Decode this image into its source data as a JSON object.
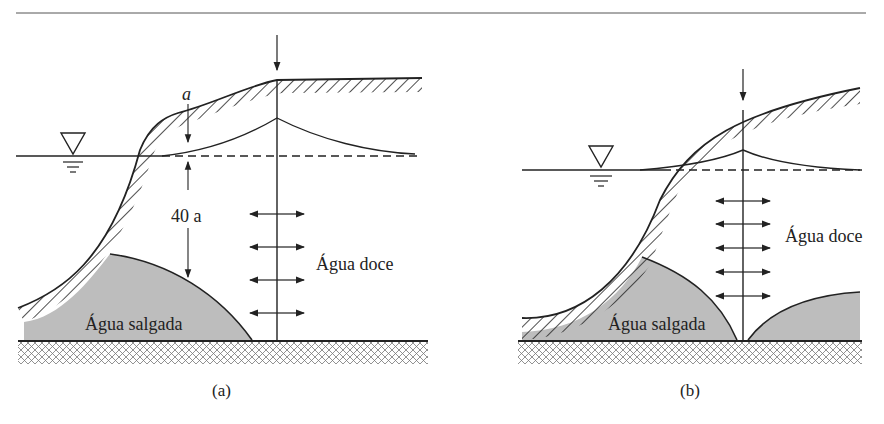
{
  "figure": {
    "panels": [
      {
        "id": "a",
        "caption": "(a)",
        "fresh_label": "Água doce",
        "salt_label": "Água salgada",
        "thickness_label_top": "a",
        "thickness_label_depth": "40 a",
        "pumping_arrows": 4
      },
      {
        "id": "b",
        "caption": "(b)",
        "fresh_label": "Água doce",
        "salt_label": "Água salgada",
        "pumping_arrows": 5
      }
    ],
    "colors": {
      "line": "#222222",
      "saltwater_fill": "#bdbdbd",
      "background": "#ffffff"
    },
    "icons": [
      "water-table-triangle-icon",
      "well-arrow-icon",
      "flow-arrow-icon"
    ]
  }
}
